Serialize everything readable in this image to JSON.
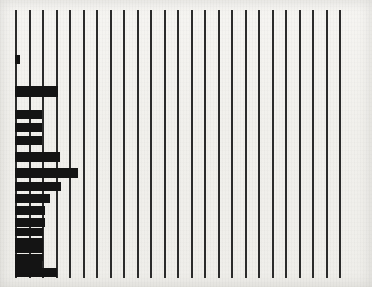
{
  "chart_data": {
    "type": "bar",
    "orientation": "horizontal",
    "title": "",
    "subtitle": "",
    "xlabel": "",
    "ylabel": "",
    "grid": true,
    "legend": null,
    "annotations": [],
    "xlim": [
      0,
      25
    ],
    "x_gridline_count": 25,
    "x_gridline_positions": [
      1,
      2,
      3,
      4,
      5,
      6,
      7,
      8,
      9,
      10,
      11,
      12,
      13,
      14,
      15,
      16,
      17,
      18,
      19,
      20,
      21,
      22,
      23,
      24,
      25
    ],
    "x_tick_labels": [],
    "y_tick_labels": [],
    "categories": [
      "row-01",
      "row-02",
      "row-03",
      "row-04",
      "row-05",
      "row-06",
      "row-07",
      "row-08",
      "row-09",
      "row-10",
      "row-11",
      "row-12",
      "row-13",
      "row-14",
      "row-15",
      "row-16",
      "row-17"
    ],
    "values": [
      0.35,
      3.2,
      2.0,
      2.0,
      2.0,
      3.3,
      4.7,
      3.4,
      2.6,
      2.2,
      2.2,
      2.1,
      2.1,
      2.05,
      2.05,
      2.0,
      3.1
    ],
    "bar_color": "#141414",
    "gridline_color": "#2b2b2b",
    "background_color": "#f3f2ef"
  },
  "figure": {
    "width": 372,
    "height": 287,
    "plot_left_px": 15,
    "plot_top_px": 10,
    "plot_bottom_px": 278,
    "gridline_spacing_px": 13.5,
    "gridline_width_px": 2,
    "bar_origin_x_px": 15,
    "bars": [
      {
        "y": 55,
        "h": 9,
        "w": 5
      },
      {
        "y": 86,
        "h": 11,
        "w": 43
      },
      {
        "y": 110,
        "h": 9,
        "w": 27
      },
      {
        "y": 123,
        "h": 9,
        "w": 27
      },
      {
        "y": 136,
        "h": 9,
        "w": 27
      },
      {
        "y": 152,
        "h": 10,
        "w": 45
      },
      {
        "y": 168,
        "h": 10,
        "w": 63
      },
      {
        "y": 182,
        "h": 9,
        "w": 46
      },
      {
        "y": 194,
        "h": 9,
        "w": 35
      },
      {
        "y": 206,
        "h": 9,
        "w": 30
      },
      {
        "y": 218,
        "h": 9,
        "w": 30
      },
      {
        "y": 228,
        "h": 8,
        "w": 28
      },
      {
        "y": 238,
        "h": 8,
        "w": 28
      },
      {
        "y": 246,
        "h": 7,
        "w": 28
      },
      {
        "y": 254,
        "h": 7,
        "w": 28
      },
      {
        "y": 261,
        "h": 7,
        "w": 27
      },
      {
        "y": 268,
        "h": 9,
        "w": 42
      }
    ]
  }
}
